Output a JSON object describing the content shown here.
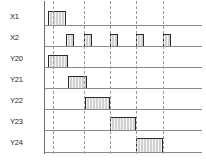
{
  "diagram": {
    "width": 206,
    "height": 160,
    "background_color": "#ffffff",
    "baseline_color": "#8a8a8a",
    "axis_color": "#6f6f6f",
    "dash_color": "#9a9a9a",
    "pulse_fill_color": "#d2d2d2",
    "pulse_border_color": "#2b2b2b",
    "axis_x": 44,
    "dashed_lines_x": [
      53,
      84,
      110,
      136,
      163
    ]
  },
  "chart_data": {
    "type": "timing",
    "xlabel": "",
    "ylabel": "",
    "grid": false,
    "legend": "none",
    "xlim": [
      0,
      206
    ],
    "time_markers": [
      53,
      84,
      110,
      136,
      163
    ],
    "signals": [
      {
        "name": "X1",
        "label": "X1",
        "label_x": 10,
        "label_y": 13,
        "baseline_y": 25,
        "baseline_x": 44,
        "baseline_w": 158,
        "pulse_height": 14,
        "pulses": [
          {
            "start": 48,
            "end": 66
          }
        ]
      },
      {
        "name": "X2",
        "label": "X2",
        "label_x": 10,
        "label_y": 34,
        "baseline_y": 46,
        "baseline_x": 44,
        "baseline_w": 158,
        "pulse_height": 12,
        "pulses": [
          {
            "start": 66,
            "end": 74
          },
          {
            "start": 84,
            "end": 92
          },
          {
            "start": 110,
            "end": 118
          },
          {
            "start": 136,
            "end": 144
          },
          {
            "start": 163,
            "end": 171
          }
        ]
      },
      {
        "name": "Y20",
        "label": "Y20",
        "label_x": 10,
        "label_y": 55,
        "baseline_y": 67,
        "baseline_x": 44,
        "baseline_w": 158,
        "pulse_height": 12,
        "pulses": [
          {
            "start": 48,
            "end": 68
          }
        ]
      },
      {
        "name": "Y21",
        "label": "Y21",
        "label_x": 10,
        "label_y": 76,
        "baseline_y": 88,
        "baseline_x": 44,
        "baseline_w": 158,
        "pulse_height": 12,
        "pulses": [
          {
            "start": 68,
            "end": 87
          }
        ]
      },
      {
        "name": "Y22",
        "label": "Y22",
        "label_x": 10,
        "label_y": 97,
        "baseline_y": 109,
        "baseline_x": 44,
        "baseline_w": 158,
        "pulse_height": 12,
        "pulses": [
          {
            "start": 85,
            "end": 110
          }
        ]
      },
      {
        "name": "Y23",
        "label": "Y23",
        "label_x": 10,
        "label_y": 118,
        "baseline_y": 130,
        "baseline_x": 44,
        "baseline_w": 158,
        "pulse_height": 13,
        "pulses": [
          {
            "start": 110,
            "end": 136
          }
        ]
      },
      {
        "name": "Y24",
        "label": "Y24",
        "label_x": 10,
        "label_y": 139,
        "baseline_y": 152,
        "baseline_x": 44,
        "baseline_w": 158,
        "pulse_height": 14,
        "pulses": [
          {
            "start": 136,
            "end": 163
          }
        ]
      }
    ]
  }
}
